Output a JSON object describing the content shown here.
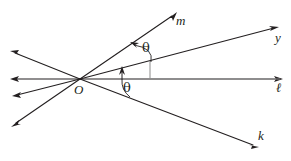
{
  "figure": {
    "type": "geometry-diagram",
    "background_color": "#ffffff",
    "line_color": "#231f20",
    "helper_color": "#8c8c8c",
    "vertex": {
      "name": "O",
      "label": "O",
      "x": 80,
      "y": 79
    },
    "rays": [
      {
        "id": "m",
        "label": "m",
        "label_x": 176,
        "label_y": 16,
        "from_x": 80,
        "from_y": 79,
        "to_x": 176,
        "to_y": 12,
        "arrow": true
      },
      {
        "id": "y",
        "label": "y",
        "label_x": 275,
        "label_y": 32,
        "from_x": 80,
        "from_y": 79,
        "to_x": 279,
        "to_y": 27,
        "arrow": true
      },
      {
        "id": "l",
        "label": "ℓ",
        "label_x": 276,
        "label_y": 82,
        "from_x": 80,
        "from_y": 79,
        "to_x": 283,
        "to_y": 79,
        "arrow": true
      },
      {
        "id": "k",
        "label": "k",
        "label_x": 258,
        "label_y": 130,
        "from_x": 80,
        "from_y": 79,
        "to_x": 258,
        "to_y": 146,
        "arrow": true
      },
      {
        "id": "m-opposite",
        "label": "",
        "from_x": 80,
        "from_y": 79,
        "to_x": 12,
        "to_y": 126,
        "arrow": true
      },
      {
        "id": "y-opposite",
        "label": "",
        "from_x": 80,
        "from_y": 79,
        "to_x": 10,
        "to_y": 52,
        "arrow": true
      },
      {
        "id": "l-opposite",
        "label": "",
        "from_x": 80,
        "from_y": 79,
        "to_x": 10,
        "to_y": 79,
        "arrow": true
      },
      {
        "id": "k-opposite",
        "label": "",
        "from_x": 80,
        "from_y": 79,
        "to_x": 12,
        "to_y": 96,
        "arrow": true
      }
    ],
    "angles": [
      {
        "id": "theta-upper",
        "label": "θ",
        "label_x": 142,
        "label_y": 42,
        "between": [
          "y",
          "m"
        ],
        "measure": "theta"
      },
      {
        "id": "theta-lower",
        "label": "θ",
        "label_x": 123,
        "label_y": 82,
        "between": [
          "l",
          "k"
        ],
        "measure": "theta"
      }
    ],
    "helper_segments": [
      {
        "id": "vertical-drop-upper",
        "from_x": 150,
        "from_y": 60,
        "to_x": 150,
        "to_y": 79
      },
      {
        "id": "baseline-tick",
        "from_x": 150,
        "from_y": 79,
        "to_x": 283,
        "to_y": 79
      }
    ]
  }
}
